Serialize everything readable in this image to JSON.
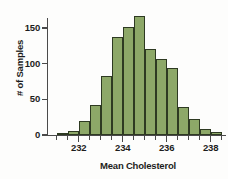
{
  "chart_data": {
    "type": "bar",
    "title": "",
    "subtitle": "",
    "xlabel": "Mean Cholesterol",
    "ylabel": "# of Samples",
    "bin_width": 0.5,
    "bin_starts": [
      231.0,
      231.5,
      232.0,
      232.5,
      233.0,
      233.5,
      234.0,
      234.5,
      235.0,
      235.5,
      236.0,
      236.5,
      237.0,
      237.5,
      238.0
    ],
    "categories": [
      "231.0-231.5",
      "231.5-232.0",
      "232.0-232.5",
      "232.5-233.0",
      "233.0-233.5",
      "233.5-234.0",
      "234.0-234.5",
      "234.5-235.0",
      "235.0-235.5",
      "235.5-236.0",
      "236.0-236.5",
      "236.5-237.0",
      "237.0-237.5",
      "237.5-238.0",
      "238.0-238.5"
    ],
    "values": [
      2,
      6,
      19,
      42,
      83,
      138,
      152,
      167,
      120,
      106,
      94,
      39,
      22,
      8,
      4
    ],
    "xlim": [
      230.6,
      238.7
    ],
    "ylim": [
      0,
      178
    ],
    "xticks": [
      232,
      234,
      236,
      238
    ],
    "xtick_labels": [
      "232",
      "234",
      "236",
      "238"
    ],
    "yticks": [
      0,
      50,
      100,
      150
    ],
    "ytick_labels": [
      "0",
      "50",
      "100",
      "150"
    ],
    "grid": false,
    "legend": false,
    "bar_fill_color": "#8da868",
    "bar_edge_color": "#2e3a22",
    "axis_color": "#4a4a4a",
    "background_color": "#fdfdfc"
  }
}
